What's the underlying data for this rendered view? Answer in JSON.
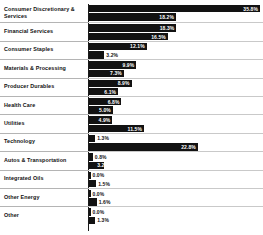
{
  "chart_data": {
    "type": "bar",
    "orientation": "horizontal",
    "title": "",
    "xlabel": "",
    "ylabel": "",
    "xlim": [
      0,
      36
    ],
    "grid": false,
    "legend": "none",
    "axis_baseline": "0%",
    "categories": [
      "Consumer Discretionary & Services",
      "Financial Services",
      "Consumer Staples",
      "Materials & Processing",
      "Producer Durables",
      "Health Care",
      "Utilities",
      "Technology",
      "Autos & Transportation",
      "Integrated Oils",
      "Other Energy",
      "Other"
    ],
    "series": [
      {
        "name": "Series 1",
        "values": [
          35.8,
          18.3,
          12.1,
          9.9,
          8.9,
          6.8,
          4.9,
          1.3,
          0.8,
          0.0,
          0.0,
          0.0
        ],
        "labels": [
          "35.8%",
          "18.3%",
          "12.1%",
          "9.9%",
          "8.9%",
          "6.8%",
          "4.9%",
          "1.3%",
          "0.8%",
          "0.0%",
          "0.0%",
          "0.0%"
        ]
      },
      {
        "name": "Series 2",
        "values": [
          18.2,
          16.5,
          3.2,
          7.3,
          6.1,
          5.0,
          11.5,
          22.8,
          3.2,
          1.5,
          1.6,
          1.3
        ],
        "labels": [
          "18.2%",
          "16.5%",
          "3.2%",
          "7.3%",
          "6.1%",
          "5.0%",
          "11.5%",
          "22.8%",
          "3.2%",
          "1.5%",
          "1.6%",
          "1.3%"
        ]
      }
    ]
  },
  "rows": [
    {
      "label": "Consumer Discretionary & Services",
      "bar1": {
        "value": 35.8,
        "text": "35.8%",
        "placement": "inside"
      },
      "bar2": {
        "value": 18.2,
        "text": "18.2%",
        "placement": "inside"
      }
    },
    {
      "label": "Financial Services",
      "bar1": {
        "value": 18.3,
        "text": "18.3%",
        "placement": "inside"
      },
      "bar2": {
        "value": 16.5,
        "text": "16.5%",
        "placement": "inside"
      }
    },
    {
      "label": "Consumer Staples",
      "bar1": {
        "value": 12.1,
        "text": "12.1%",
        "placement": "inside"
      },
      "bar2": {
        "value": 3.2,
        "text": "3.2%",
        "placement": "outside"
      }
    },
    {
      "label": "Materials & Processing",
      "bar1": {
        "value": 9.9,
        "text": "9.9%",
        "placement": "inside"
      },
      "bar2": {
        "value": 7.3,
        "text": "7.3%",
        "placement": "inside"
      }
    },
    {
      "label": "Producer Durables",
      "bar1": {
        "value": 8.9,
        "text": "8.9%",
        "placement": "inside"
      },
      "bar2": {
        "value": 6.1,
        "text": "6.1%",
        "placement": "inside"
      }
    },
    {
      "label": "Health Care",
      "bar1": {
        "value": 6.8,
        "text": "6.8%",
        "placement": "inside"
      },
      "bar2": {
        "value": 5.0,
        "text": "5.0%",
        "placement": "inside"
      }
    },
    {
      "label": "Utilities",
      "bar1": {
        "value": 4.9,
        "text": "4.9%",
        "placement": "inside"
      },
      "bar2": {
        "value": 11.5,
        "text": "11.5%",
        "placement": "inside"
      }
    },
    {
      "label": "Technology",
      "bar1": {
        "value": 1.3,
        "text": "1.3%",
        "placement": "outside"
      },
      "bar2": {
        "value": 22.8,
        "text": "22.8%",
        "placement": "inside"
      }
    },
    {
      "label": "Autos & Transportation",
      "bar1": {
        "value": 0.8,
        "text": "0.8%",
        "placement": "outside"
      },
      "bar2": {
        "value": 3.2,
        "text": "3.2%",
        "placement": "inside"
      }
    },
    {
      "label": "Integrated Oils",
      "bar1": {
        "value": 0.0,
        "text": "0.0%",
        "placement": "outside"
      },
      "bar2": {
        "value": 1.5,
        "text": "1.5%",
        "placement": "outside"
      }
    },
    {
      "label": "Other Energy",
      "bar1": {
        "value": 0.0,
        "text": "0.0%",
        "placement": "outside"
      },
      "bar2": {
        "value": 1.6,
        "text": "1.6%",
        "placement": "outside"
      }
    },
    {
      "label": "Other",
      "bar1": {
        "value": 0.0,
        "text": "0.0%",
        "placement": "outside"
      },
      "bar2": {
        "value": 1.3,
        "text": "1.3%",
        "placement": "outside"
      }
    }
  ],
  "style": {
    "bar_color": "#121212",
    "axis_color": "#1a1a1a",
    "divider_color": "#b4b4b4",
    "text_color": "#101010",
    "inside_text_color": "#ffffff",
    "background": "#ffffff"
  }
}
